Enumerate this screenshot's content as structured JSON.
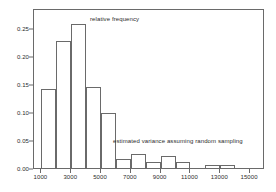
{
  "chart_data": {
    "type": "bar",
    "title": "",
    "subtitle": "",
    "xlabel": "",
    "ylabel": "",
    "grid": false,
    "legend_position": "none",
    "xlim": [
      500,
      16000
    ],
    "ylim": [
      0.0,
      0.285
    ],
    "bin_width": 1000,
    "bin_starts": [
      1000,
      2000,
      3000,
      4000,
      5000,
      6000,
      7000,
      8000,
      9000,
      10000,
      11000,
      12000,
      13000
    ],
    "categories": [
      "1000-2000",
      "2000-3000",
      "3000-4000",
      "4000-5000",
      "5000-6000",
      "6000-7000",
      "7000-8000",
      "8000-9000",
      "9000-10000",
      "10000-11000",
      "11000-12000",
      "12000-13000",
      "13000-14000"
    ],
    "values": [
      0.141,
      0.226,
      0.257,
      0.145,
      0.098,
      0.016,
      0.025,
      0.011,
      0.021,
      0.011,
      0.0,
      0.005,
      0.005
    ],
    "yticks": [
      0.0,
      0.05,
      0.1,
      0.15,
      0.2,
      0.25
    ],
    "ytick_labels": [
      "0.00",
      "0.05",
      "0.10",
      "0.15",
      "0.20",
      "0.25"
    ],
    "xticks": [
      1000,
      3000,
      5000,
      7000,
      9000,
      11000,
      13000,
      15000
    ],
    "xtick_labels": [
      "1000",
      "3000",
      "5000",
      "7000",
      "9000",
      "11000",
      "13000",
      "15000"
    ],
    "annotations": [
      {
        "text": "relative frequency",
        "x": 6000,
        "y": 0.268
      },
      {
        "text": "estimated variance assuming random sampling",
        "x": 7200,
        "y": 0.057
      }
    ],
    "colors": {
      "bar_edge": "#6a6a6a",
      "bar_fill": "transparent",
      "axis": "#6a6a6a",
      "text": "#2b2b2b",
      "background": "#ffffff"
    }
  }
}
